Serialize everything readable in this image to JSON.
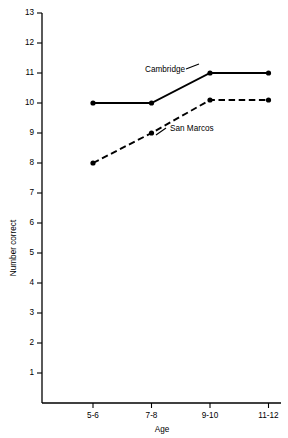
{
  "chart_data": {
    "type": "line",
    "title": "",
    "xlabel": "Age",
    "ylabel": "Number correct",
    "categories": [
      "5-6",
      "7-8",
      "9-10",
      "11-12"
    ],
    "ytick_labels": [
      "1",
      "2",
      "3",
      "4",
      "5",
      "6",
      "7",
      "8",
      "9",
      "10",
      "11",
      "12",
      "13"
    ],
    "yticks": [
      1,
      2,
      3,
      4,
      5,
      6,
      7,
      8,
      9,
      10,
      11,
      12,
      13
    ],
    "ylim": [
      0,
      13
    ],
    "grid": false,
    "legend_position": "inline-annotation",
    "series": [
      {
        "name": "Cambridge",
        "style": "solid",
        "color": "#000000",
        "marker": "filled-circle",
        "values": [
          10,
          10,
          11,
          11
        ],
        "label_x_category": "7-8",
        "label_text": "Cambridge"
      },
      {
        "name": "San Marcos",
        "style": "dashed",
        "color": "#000000",
        "marker": "filled-circle",
        "values": [
          8,
          9,
          10.1,
          10.1
        ],
        "label_x_category": "9-10",
        "label_text": "San Marcos"
      }
    ],
    "annotations": [
      {
        "text": "Cambridge",
        "x": 145,
        "y": 72
      },
      {
        "text": "San Marcos",
        "x": 170,
        "y": 131
      }
    ]
  },
  "axes": {
    "y_title": "Number correct",
    "x_title": "Age"
  }
}
